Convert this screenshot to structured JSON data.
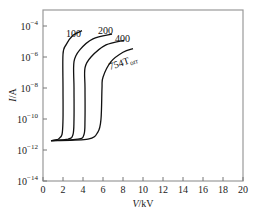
{
  "chart_data": {
    "type": "line",
    "title": "",
    "xlabel_italic": "V",
    "xlabel_unit": "/kV",
    "ylabel_italic": "I",
    "ylabel_unit": "/A",
    "xlim": [
      0,
      20
    ],
    "ylim_log10": [
      -14,
      -3
    ],
    "yscale": "log",
    "grid": false,
    "x_ticks": [
      0,
      2,
      4,
      6,
      8,
      10,
      12,
      14,
      16,
      18,
      20
    ],
    "y_ticks": [
      {
        "exp": -4,
        "base": "10",
        "sup": "−4"
      },
      {
        "exp": -6,
        "base": "10",
        "sup": "−6"
      },
      {
        "exp": -8,
        "base": "10",
        "sup": "−8"
      },
      {
        "exp": -10,
        "base": "10",
        "sup": "−10"
      },
      {
        "exp": -12,
        "base": "10",
        "sup": "−12"
      },
      {
        "exp": -14,
        "base": "10",
        "sup": "−14"
      }
    ],
    "series": [
      {
        "name": "100",
        "label": "100",
        "points": [
          [
            0.8,
            4e-12
          ],
          [
            1.5,
            5e-12
          ],
          [
            1.9,
            1e-11
          ],
          [
            2.0,
            1e-10
          ],
          [
            2.0,
            1e-08
          ],
          [
            2.0,
            1.5e-06
          ],
          [
            2.3,
            6e-06
          ],
          [
            3.0,
            2.5e-05
          ],
          [
            3.9,
            5e-05
          ]
        ]
      },
      {
        "name": "200",
        "label": "200",
        "points": [
          [
            0.8,
            4e-12
          ],
          [
            2.5,
            5e-12
          ],
          [
            3.0,
            1e-11
          ],
          [
            3.1,
            1e-10
          ],
          [
            3.1,
            1e-08
          ],
          [
            3.1,
            5e-07
          ],
          [
            3.7,
            3e-06
          ],
          [
            5.0,
            1.5e-05
          ],
          [
            6.9,
            3e-05
          ]
        ]
      },
      {
        "name": "400",
        "label": "400",
        "points": [
          [
            0.8,
            4e-12
          ],
          [
            3.5,
            5e-12
          ],
          [
            4.1,
            1e-11
          ],
          [
            4.2,
            1e-10
          ],
          [
            4.2,
            1e-08
          ],
          [
            4.2,
            2e-07
          ],
          [
            4.8,
            1e-06
          ],
          [
            6.3,
            6e-06
          ],
          [
            8.1,
            1.2e-05
          ]
        ]
      },
      {
        "name": "754 Torr",
        "label": "754T",
        "label_sub": "orr",
        "points": [
          [
            0.8,
            4e-12
          ],
          [
            4.5,
            5e-12
          ],
          [
            5.5,
            1.5e-11
          ],
          [
            5.8,
            1e-10
          ],
          [
            5.9,
            1e-08
          ],
          [
            6.0,
            5e-08
          ],
          [
            6.8,
            5e-07
          ],
          [
            8.0,
            2e-06
          ],
          [
            9.0,
            3.5e-06
          ]
        ]
      }
    ]
  }
}
